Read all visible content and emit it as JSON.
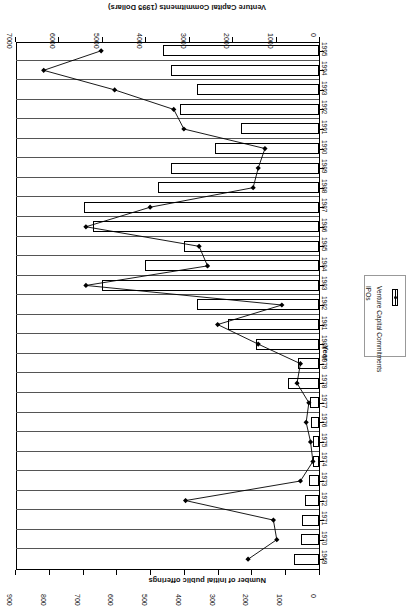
{
  "chart_data": {
    "type": "bar",
    "title": "",
    "subtitle": "",
    "xlabel": "Year",
    "ylabel": "Venture Capital Commitments (1995 Dollars)",
    "y2label": "Number of Initial public offerings",
    "orientation": "horizontal-bars-rotated-180",
    "grid": false,
    "legend_position": "right-middle",
    "categories": [
      "1969",
      "1970",
      "1971",
      "1972",
      "1973",
      "1974",
      "1975",
      "1976",
      "1977",
      "1978",
      "1979",
      "1980",
      "1981",
      "1982",
      "1983",
      "1984",
      "1985",
      "1986",
      "1987",
      "1988",
      "1989",
      "1990",
      "1991",
      "1992",
      "1993",
      "1994",
      "1995"
    ],
    "axes": {
      "vc": {
        "label": "Venture Capital Commitments (1995 Dollars)",
        "ticks": [
          0,
          1000,
          2000,
          3000,
          4000,
          5000,
          6000,
          7000
        ],
        "tick_labels": [
          "0",
          "1000",
          "2000",
          "3000",
          "4000",
          "5000",
          "6000",
          "7000"
        ],
        "min": 0,
        "max": 7000
      },
      "ipo": {
        "label": "Number of Initial public offerings",
        "ticks": [
          0,
          100,
          200,
          300,
          400,
          500,
          600,
          700,
          800,
          900
        ],
        "tick_labels": [
          "0",
          "100",
          "200",
          "300",
          "400",
          "500",
          "600",
          "700",
          "800",
          "900"
        ],
        "min": 0,
        "max": 900
      },
      "year": {
        "label": "Year"
      }
    },
    "series": [
      {
        "name": "Venture Capital Commitments",
        "kind": "bar",
        "axis": "vc",
        "values": [
          570,
          420,
          400,
          320,
          230,
          130,
          130,
          180,
          200,
          720,
          490,
          1450,
          2100,
          2800,
          5000,
          4000,
          3100,
          5200,
          5400,
          3700,
          3400,
          2400,
          1800,
          3200,
          2800,
          3400,
          3600
        ]
      },
      {
        "name": "IPOs",
        "kind": "line",
        "axis": "ipo",
        "marker": "filled-diamond",
        "values": [
          210,
          125,
          135,
          395,
          55,
          18,
          25,
          38,
          30,
          65,
          55,
          180,
          300,
          110,
          690,
          330,
          355,
          690,
          500,
          195,
          180,
          160,
          400,
          430,
          605,
          815,
          645
        ]
      }
    ]
  },
  "legend": {
    "items": [
      {
        "label": "Venture Capital Commitments",
        "swatch": "bar-outline"
      },
      {
        "label": "IPOs",
        "swatch": "line-marker"
      }
    ]
  }
}
